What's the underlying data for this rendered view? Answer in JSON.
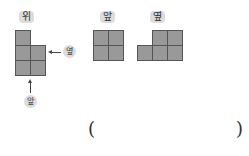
{
  "views": {
    "top": {
      "label": "위",
      "cells": [
        [
          0,
          0
        ],
        [
          0,
          1
        ],
        [
          1,
          1
        ],
        [
          0,
          2
        ],
        [
          1,
          2
        ]
      ]
    },
    "front": {
      "label": "앞",
      "cells": [
        [
          0,
          0
        ],
        [
          1,
          0
        ],
        [
          0,
          1
        ],
        [
          1,
          1
        ]
      ]
    },
    "side": {
      "label": "옆",
      "cells": [
        [
          1,
          0
        ],
        [
          2,
          0
        ],
        [
          0,
          1
        ],
        [
          1,
          1
        ],
        [
          2,
          1
        ]
      ]
    }
  },
  "direction_labels": {
    "side_arrow": "옆",
    "front_arrow": "앞"
  },
  "answer": {
    "open": "(",
    "close": ")",
    "value": ""
  }
}
